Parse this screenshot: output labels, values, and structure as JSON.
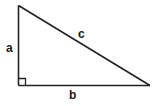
{
  "diagram": {
    "type": "right-triangle",
    "stroke_color": "#222222",
    "background": "#ffffff",
    "vertices": {
      "top": [
        18.5,
        5.5
      ],
      "right_angle": [
        18.5,
        85.5
      ],
      "right": [
        150,
        85.5
      ]
    },
    "right_angle_marker_size": 7,
    "labels": {
      "a": "a",
      "b": "b",
      "c": "c"
    }
  }
}
